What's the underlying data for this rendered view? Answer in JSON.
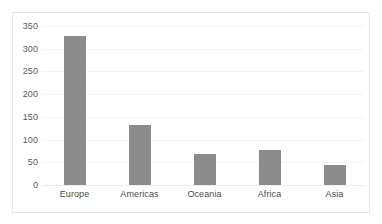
{
  "chart_data": {
    "type": "bar",
    "title": "",
    "subtitle": "",
    "xlabel": "",
    "ylabel": "",
    "categories": [
      "Europe",
      "Americas",
      "Oceania",
      "Africa",
      "Asia"
    ],
    "values": [
      328,
      131,
      68,
      78,
      45
    ],
    "ylim": [
      0,
      350
    ],
    "ytick_labels": [
      "0",
      "50",
      "100",
      "150",
      "200",
      "250",
      "300",
      "350"
    ],
    "ytick_values": [
      0,
      50,
      100,
      150,
      200,
      250,
      300,
      350
    ],
    "grid": true,
    "grid_axis": "y",
    "legend": false,
    "legend_position": "none",
    "annotations": [],
    "series": [
      {
        "name": "Count",
        "values": [
          328,
          131,
          68,
          78,
          45
        ]
      }
    ]
  },
  "style": {
    "bar_color": "#8c8c8c",
    "grid_color": "#f4f4f4",
    "frame_color": "#e8e8e8",
    "axis_text_color": "#5a5a5a",
    "category_text_color": "#4a4a4a",
    "background": "#ffffff"
  }
}
